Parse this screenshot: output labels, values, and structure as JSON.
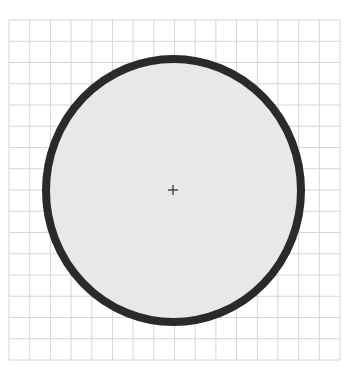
{
  "figure": {
    "grid": {
      "x0": 9,
      "y0": 20,
      "x1": 340,
      "y1": 360,
      "cols": 16,
      "rows": 16,
      "line_color": "#d6d6d6"
    },
    "circle": {
      "cx": 173.5,
      "cy": 190.5,
      "rx": 127.5,
      "ry": 131.5,
      "stroke_width": 8,
      "stroke_color": "#2a2a2a",
      "fill_color": "#e8e8e8"
    },
    "center_marker": {
      "x": 173,
      "y": 190,
      "size": 5,
      "color": "#333333"
    }
  }
}
